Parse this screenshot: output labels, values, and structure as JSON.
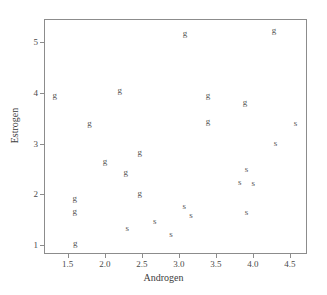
{
  "chart_data": {
    "type": "scatter",
    "title": "",
    "subtitle": "",
    "xlabel": "Androgen",
    "ylabel": "Estrogen",
    "xlim": [
      1.18,
      4.73
    ],
    "ylim": [
      0.83,
      5.45
    ],
    "xticks": [
      "1.5",
      "2.0",
      "2.5",
      "3.0",
      "3.5",
      "4.0",
      "4.5"
    ],
    "xtick_values": [
      1.5,
      2.0,
      2.5,
      3.0,
      3.5,
      4.0,
      4.5
    ],
    "yticks": [
      "1",
      "2",
      "3",
      "4",
      "5"
    ],
    "ytick_values": [
      1,
      2,
      3,
      4,
      5
    ],
    "grid": false,
    "legend": "none",
    "marker_style": "text-label",
    "point_color": "#555555",
    "frame_color": "#8c8c8c",
    "background_color": "#ffffff",
    "series": [
      {
        "name": "g",
        "label": "g",
        "marker": "g",
        "points": [
          {
            "x": 1.31,
            "y": 3.98,
            "label": "g"
          },
          {
            "x": 1.78,
            "y": 3.43,
            "label": "g"
          },
          {
            "x": 1.58,
            "y": 1.96,
            "label": "g"
          },
          {
            "x": 1.58,
            "y": 1.7,
            "label": "g"
          },
          {
            "x": 1.59,
            "y": 1.07,
            "label": "g"
          },
          {
            "x": 1.99,
            "y": 2.67,
            "label": "g"
          },
          {
            "x": 2.19,
            "y": 4.07,
            "label": "g"
          },
          {
            "x": 2.27,
            "y": 2.46,
            "label": "g"
          },
          {
            "x": 2.46,
            "y": 2.85,
            "label": "g"
          },
          {
            "x": 2.46,
            "y": 2.05,
            "label": "g"
          },
          {
            "x": 3.07,
            "y": 5.19,
            "label": "g"
          },
          {
            "x": 3.38,
            "y": 3.97,
            "label": "g"
          },
          {
            "x": 3.38,
            "y": 3.47,
            "label": "g"
          },
          {
            "x": 3.88,
            "y": 3.83,
            "label": "g"
          },
          {
            "x": 4.27,
            "y": 5.25,
            "label": "g"
          }
        ]
      },
      {
        "name": "s",
        "label": "s",
        "marker": "s",
        "points": [
          {
            "x": 2.29,
            "y": 1.36,
            "label": "s"
          },
          {
            "x": 2.66,
            "y": 1.49,
            "label": "s"
          },
          {
            "x": 2.88,
            "y": 1.25,
            "label": "s"
          },
          {
            "x": 3.06,
            "y": 1.79,
            "label": "s"
          },
          {
            "x": 3.15,
            "y": 1.62,
            "label": "s"
          },
          {
            "x": 3.81,
            "y": 2.27,
            "label": "s"
          },
          {
            "x": 3.9,
            "y": 2.52,
            "label": "s"
          },
          {
            "x": 3.9,
            "y": 1.68,
            "label": "s"
          },
          {
            "x": 3.99,
            "y": 2.25,
            "label": "s"
          },
          {
            "x": 4.29,
            "y": 3.04,
            "label": "s"
          },
          {
            "x": 4.56,
            "y": 3.43,
            "label": "s"
          }
        ]
      }
    ]
  }
}
